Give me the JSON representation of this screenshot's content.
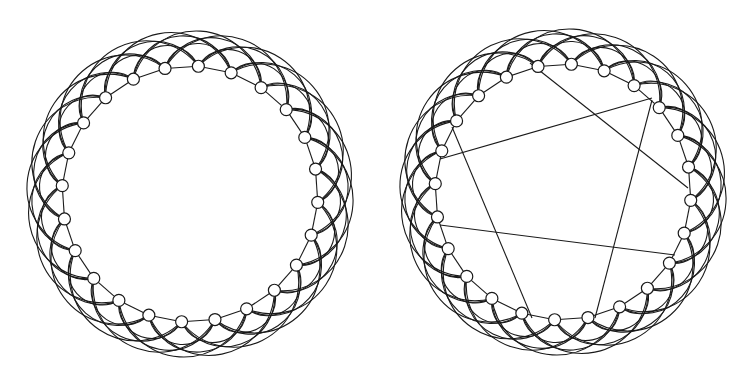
{
  "figure": {
    "panels": [
      {
        "id": "regular-lattice",
        "cx": 190,
        "cy": 194,
        "r": 128,
        "node_count": 24,
        "neighbors_per_side": 4,
        "node_radius": 6,
        "shortcuts": []
      },
      {
        "id": "rewired-small-world",
        "cx": 563,
        "cy": 192,
        "r": 128,
        "node_count": 24,
        "neighbors_per_side": 4,
        "node_radius": 6,
        "shortcuts": [
          {
            "from": [
              530,
              63
            ],
            "to": [
              688,
              188
            ]
          },
          {
            "from": [
              652,
              98
            ],
            "to": [
              440,
              159
            ]
          },
          {
            "from": [
              452,
              127
            ],
            "to": [
              532,
              318
            ]
          },
          {
            "from": [
              652,
              100
            ],
            "to": [
              595,
              318
            ]
          },
          {
            "from": [
              440,
              225
            ],
            "to": [
              675,
              255
            ]
          }
        ]
      }
    ],
    "colors": {
      "stroke": "#1a1a1a",
      "node_fill": "#ffffff",
      "background": "#ffffff"
    }
  }
}
